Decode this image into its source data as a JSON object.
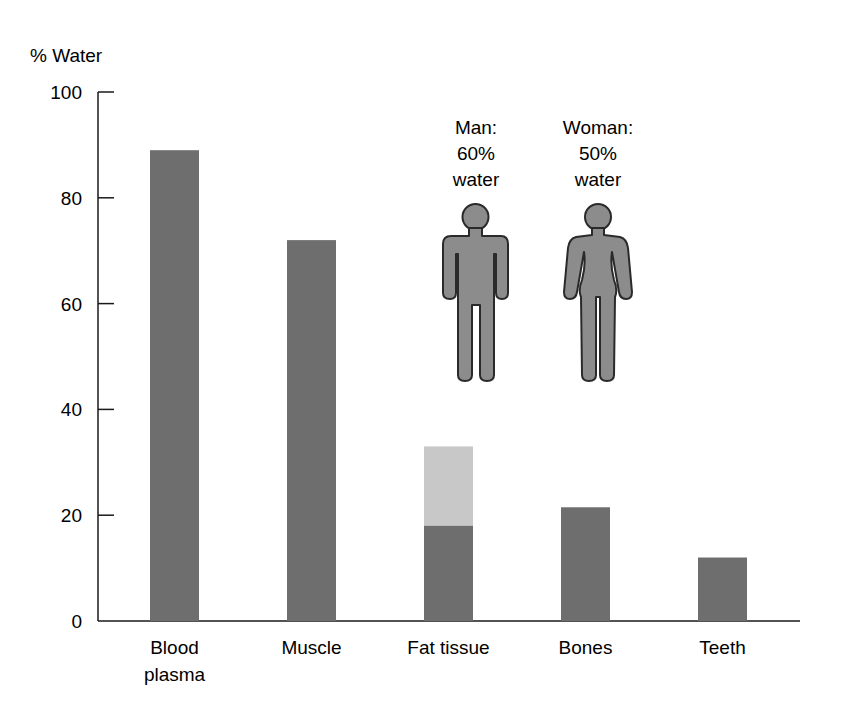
{
  "chart_data": {
    "type": "bar",
    "title": "",
    "xlabel": "",
    "ylabel": "% Water",
    "ylim": [
      0,
      100
    ],
    "yticks": [
      0,
      20,
      40,
      60,
      80,
      100
    ],
    "grid": false,
    "categories": [
      "Blood plasma",
      "Muscle",
      "Fat tissue",
      "Bones",
      "Teeth"
    ],
    "category_lines": [
      [
        "Blood",
        "plasma"
      ],
      [
        "Muscle"
      ],
      [
        "Fat tissue"
      ],
      [
        "Bones"
      ],
      [
        "Teeth"
      ]
    ],
    "series": [
      {
        "name": "Water content",
        "values": [
          89,
          72,
          18,
          21.5,
          12
        ]
      }
    ],
    "ranges": [
      {
        "category": "Fat tissue",
        "low": 18,
        "high": 33,
        "note": "lighter upper segment shows range"
      }
    ],
    "annotations": [
      {
        "figure": "man",
        "lines": [
          "Man:",
          "60%",
          "water"
        ],
        "value": 60
      },
      {
        "figure": "woman",
        "lines": [
          "Woman:",
          "50%",
          "water"
        ],
        "value": 50
      }
    ]
  },
  "colors": {
    "bar": "#6e6e6e",
    "bar_range": "#c8c8c8",
    "figure_fill": "#8c8c8c",
    "figure_stroke": "#2a2a2a",
    "axis": "#1a1a1a"
  }
}
